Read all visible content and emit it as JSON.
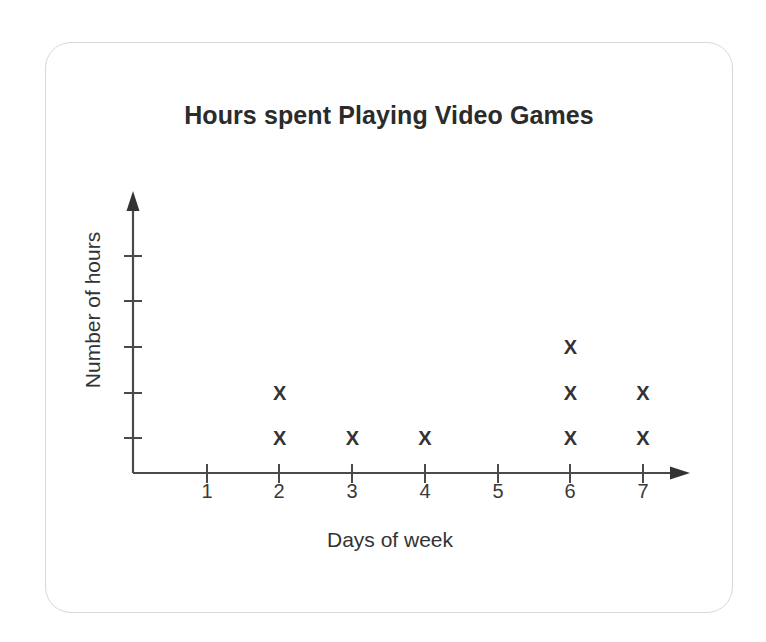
{
  "card": {
    "border_color": "#d8d8d8",
    "background": "#ffffff"
  },
  "chart_data": {
    "type": "scatter",
    "title": "Hours spent Playing Video Games",
    "xlabel": "Days of week",
    "ylabel": "Number of hours",
    "categories": [
      "1",
      "2",
      "3",
      "4",
      "5",
      "6",
      "7"
    ],
    "x": [
      1,
      2,
      3,
      4,
      5,
      6,
      7
    ],
    "values": [
      0,
      2,
      1,
      1,
      0,
      3,
      2
    ],
    "marker": "X",
    "marker_color": "#333333",
    "axis_color": "#4a4a4a",
    "grid": false,
    "legend": null,
    "xlim": [
      0,
      7.6
    ],
    "ylim": [
      0,
      5
    ],
    "y_tick_labels": [
      "",
      "",
      "",
      "",
      ""
    ],
    "y_ticks_unlabeled_count": 5,
    "points": [
      {
        "day": 2,
        "stack": 1
      },
      {
        "day": 2,
        "stack": 2
      },
      {
        "day": 3,
        "stack": 1
      },
      {
        "day": 4,
        "stack": 1
      },
      {
        "day": 6,
        "stack": 1
      },
      {
        "day": 6,
        "stack": 2
      },
      {
        "day": 6,
        "stack": 3
      },
      {
        "day": 7,
        "stack": 1
      },
      {
        "day": 7,
        "stack": 2
      }
    ]
  }
}
